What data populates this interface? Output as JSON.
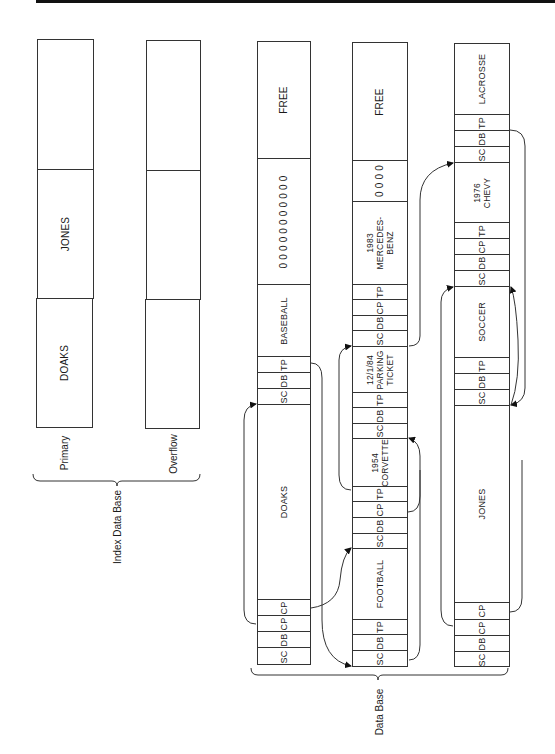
{
  "index_data_base": {
    "label": "Index Data Base",
    "primary": {
      "label": "Primary",
      "segments": [
        "DOAKS",
        "JONES",
        ""
      ]
    },
    "overflow": {
      "label": "Overflow",
      "segments": [
        "",
        "",
        ""
      ]
    }
  },
  "data_base": {
    "label": "Data Base",
    "columns": [
      {
        "segments": [
          {
            "text": "SC"
          },
          {
            "text": "DB"
          },
          {
            "text": "CP"
          },
          {
            "text": "CP"
          },
          {
            "text": "DOAKS"
          },
          {
            "text": "SC"
          },
          {
            "text": "DB"
          },
          {
            "text": "TP"
          },
          {
            "text": "BASEBALL"
          },
          {
            "text": "0 0 0 0 0 0 0 0 0 0 0"
          },
          {
            "text": "FREE"
          }
        ]
      },
      {
        "segments": [
          {
            "text": "SC"
          },
          {
            "text": "DB"
          },
          {
            "text": "TP"
          },
          {
            "text": "FOOTBALL"
          },
          {
            "text": "SC"
          },
          {
            "text": "DB"
          },
          {
            "text": "CP"
          },
          {
            "text": "TP"
          },
          {
            "line1": "1954",
            "line2": "CORVETTE"
          },
          {
            "text": "SC"
          },
          {
            "text": "DB"
          },
          {
            "text": "TP"
          },
          {
            "line1": "12/1/84",
            "line2": "PARKING",
            "line3": "TICKET"
          },
          {
            "text": "SC"
          },
          {
            "text": "DB"
          },
          {
            "text": "CP"
          },
          {
            "text": "TP"
          },
          {
            "line1": "1983",
            "line2": "MERCEDES-",
            "line3": "BENZ"
          },
          {
            "text": "0 0 0 0"
          },
          {
            "text": "FREE"
          }
        ]
      },
      {
        "segments": [
          {
            "text": "SC"
          },
          {
            "text": "DB"
          },
          {
            "text": "CP"
          },
          {
            "text": "CP"
          },
          {
            "text": "JONES"
          },
          {
            "text": "SC"
          },
          {
            "text": "DB"
          },
          {
            "text": "TP"
          },
          {
            "text": "SOCCER"
          },
          {
            "text": "SC"
          },
          {
            "text": "DB"
          },
          {
            "text": "CP"
          },
          {
            "text": "TP"
          },
          {
            "line1": "1976",
            "line2": "CHEVY"
          },
          {
            "text": "SC"
          },
          {
            "text": "DB"
          },
          {
            "text": "TP"
          },
          {
            "text": "LACROSSE"
          }
        ]
      }
    ]
  },
  "colors": {
    "line": "#333333",
    "text": "#1a1a1a",
    "background": "#ffffff"
  }
}
